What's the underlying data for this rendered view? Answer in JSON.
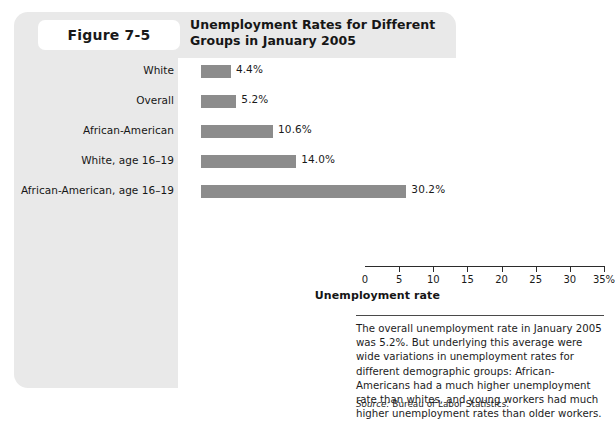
{
  "figure": {
    "label": "Figure 7-5",
    "title": "Unemployment Rates for Different Groups in January 2005"
  },
  "caption": {
    "body": "The overall unemployment rate in January 2005 was 5.2%. But underlying this average were wide variations in unemployment rates for different demographic groups: African-Americans had a much higher unemployment rate than whites, and young workers had much higher unemployment rates than older workers.",
    "source_label": "Source:",
    "source_text": "Bureau of Labor Statistics."
  },
  "colors": {
    "bar": "#8c8c8c",
    "card_background": "#e9e9e9",
    "panel_background": "#ffffff",
    "axis": "#2b2b2b"
  },
  "chart_data": {
    "type": "bar",
    "orientation": "horizontal",
    "title": "Unemployment Rates for Different Groups in January 2005",
    "categories": [
      "White",
      "Overall",
      "African-American",
      "White, age 16–19",
      "African-American, age 16–19"
    ],
    "values": [
      4.4,
      5.2,
      10.6,
      14.0,
      30.2
    ],
    "value_labels": [
      "4.4%",
      "5.2%",
      "10.6%",
      "14.0%",
      "30.2%"
    ],
    "xlabel": "Unemployment rate",
    "ylabel": "",
    "xlim": [
      0,
      35
    ],
    "xticks": [
      0,
      5,
      10,
      15,
      20,
      25,
      30,
      35
    ],
    "xtick_labels": [
      "0",
      "5",
      "10",
      "15",
      "20",
      "25",
      "30",
      "35%"
    ],
    "grid": false,
    "legend": false
  }
}
